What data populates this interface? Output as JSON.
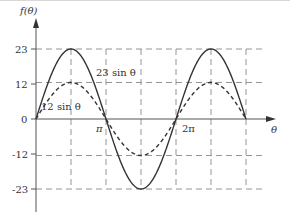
{
  "chart_data": {
    "type": "line",
    "title": "",
    "xlabel": "θ",
    "ylabel": "f(θ)",
    "ylim": [
      -23,
      23
    ],
    "xlim": [
      0,
      "4π"
    ],
    "grid": "dashed at ±12, ±23 and every π/2",
    "y_ticks": [
      "23",
      "12",
      "0",
      "-12",
      "-23"
    ],
    "x_tick_labels": [
      "π",
      "2π"
    ],
    "x": [
      "0",
      "π/2",
      "π",
      "3π/2",
      "2π",
      "5π/2",
      "3π"
    ],
    "series": [
      {
        "name": "23 sin θ",
        "style": "solid",
        "amplitude": 23,
        "values": [
          0,
          23,
          0,
          -23,
          0,
          23,
          0
        ]
      },
      {
        "name": "12 sin θ",
        "style": "dashed",
        "amplitude": 12,
        "values": [
          0,
          12,
          0,
          -12,
          0,
          12,
          0
        ]
      }
    ],
    "annotations": [
      {
        "text": "23 sin θ",
        "near": "first positive peak of solid curve"
      },
      {
        "text": "12 sin θ",
        "near": "first positive peak of dashed curve"
      }
    ]
  },
  "labels": {
    "y_axis": "f(θ)",
    "x_axis": "θ",
    "tick_23": "23",
    "tick_12": "12",
    "tick_0": "0",
    "tick_m12": "-12",
    "tick_m23": "-23",
    "pi": "π",
    "two_pi": "2π",
    "series_a": "23 sin θ",
    "series_b": "12 sin θ"
  },
  "colors": {
    "curve": "#333333",
    "grid": "#888888",
    "axis": "#555555"
  }
}
